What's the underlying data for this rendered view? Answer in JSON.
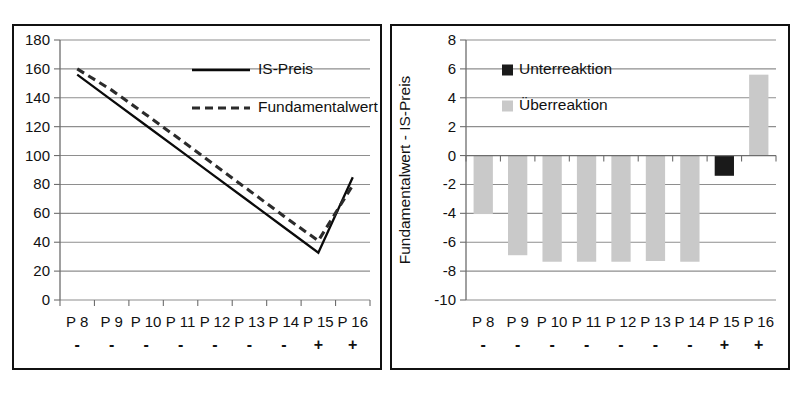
{
  "chart_data": [
    {
      "type": "line",
      "panel": "left",
      "title": "",
      "xlabel": "",
      "ylabel": "",
      "ylim": [
        0,
        180
      ],
      "ytick_labels": [
        "0",
        "20",
        "40",
        "60",
        "80",
        "100",
        "120",
        "140",
        "160",
        "180"
      ],
      "ytick_values": [
        0,
        20,
        40,
        60,
        80,
        100,
        120,
        140,
        160,
        180
      ],
      "grid": true,
      "legend_position": "top-center",
      "categories": [
        "P 8",
        "P 9",
        "P 10",
        "P 11",
        "P 12",
        "P 13",
        "P 14",
        "P 15",
        "P 16"
      ],
      "category_signs": [
        "-",
        "-",
        "-",
        "-",
        "-",
        "-",
        "-",
        "+",
        "+"
      ],
      "series": [
        {
          "name": "IS-Preis",
          "style": "solid",
          "values": [
            156.0,
            138.4,
            120.8,
            103.2,
            85.6,
            68.0,
            50.4,
            32.8,
            85.0
          ]
        },
        {
          "name": "Fundamentalwert",
          "style": "dashed",
          "values": [
            160.0,
            145.3,
            128.3,
            110.9,
            93.3,
            75.7,
            58.0,
            41.0,
            79.5
          ]
        }
      ]
    },
    {
      "type": "bar",
      "panel": "right",
      "title": "",
      "xlabel": "",
      "ylabel": "Fundamentalwert - IS-Preis",
      "ylim": [
        -10,
        8
      ],
      "ytick_labels": [
        "-10",
        "-8",
        "-6",
        "-4",
        "-2",
        "0",
        "2",
        "4",
        "6",
        "8"
      ],
      "ytick_values": [
        -10,
        -8,
        -6,
        -4,
        -2,
        0,
        2,
        4,
        6,
        8
      ],
      "grid": true,
      "legend_position": "top-left",
      "categories": [
        "P 8",
        "P 9",
        "P 10",
        "P 11",
        "P 12",
        "P 13",
        "P 14",
        "P 15",
        "P 16"
      ],
      "category_signs": [
        "-",
        "-",
        "-",
        "-",
        "-",
        "-",
        "-",
        "+",
        "+"
      ],
      "values": [
        -4.05,
        -6.9,
        -7.35,
        -7.35,
        -7.35,
        -7.3,
        -7.35,
        -1.4,
        5.6
      ],
      "bar_kinds": [
        "ueber",
        "ueber",
        "ueber",
        "ueber",
        "ueber",
        "ueber",
        "ueber",
        "unter",
        "ueber"
      ],
      "legend": [
        {
          "name": "Unterreaktion",
          "color": "#1a1a1a"
        },
        {
          "name": "Überreaktion",
          "color": "#c9c9c9"
        }
      ]
    }
  ],
  "left_chart": {
    "legend": {
      "is_preis": "IS-Preis",
      "fundamentalwert": "Fundamentalwert"
    },
    "y_labels": {
      "t0": "0",
      "t1": "20",
      "t2": "40",
      "t3": "60",
      "t4": "80",
      "t5": "100",
      "t6": "120",
      "t7": "140",
      "t8": "160",
      "t9": "180"
    },
    "x_labels": {
      "c0": "P 8",
      "c1": "P 9",
      "c2": "P 10",
      "c3": "P 11",
      "c4": "P 12",
      "c5": "P 13",
      "c6": "P 14",
      "c7": "P 15",
      "c8": "P 16"
    },
    "x_signs": {
      "s0": "-",
      "s1": "-",
      "s2": "-",
      "s3": "-",
      "s4": "-",
      "s5": "-",
      "s6": "-",
      "s7": "+",
      "s8": "+"
    }
  },
  "right_chart": {
    "y_axis_title": "Fundamentalwert - IS-Preis",
    "legend": {
      "unterreaktion": "Unterreaktion",
      "ueberreaktion": "Überreaktion"
    },
    "y_labels": {
      "t0": "-10",
      "t1": "-8",
      "t2": "-6",
      "t3": "-4",
      "t4": "-2",
      "t5": "0",
      "t6": "2",
      "t7": "4",
      "t8": "6",
      "t9": "8"
    },
    "x_labels": {
      "c0": "P 8",
      "c1": "P 9",
      "c2": "P 10",
      "c3": "P 11",
      "c4": "P 12",
      "c5": "P 13",
      "c6": "P 14",
      "c7": "P 15",
      "c8": "P 16"
    },
    "x_signs": {
      "s0": "-",
      "s1": "-",
      "s2": "-",
      "s3": "-",
      "s4": "-",
      "s5": "-",
      "s6": "-",
      "s7": "+",
      "s8": "+"
    }
  },
  "colors": {
    "bar_ueber": "#c9c9c9",
    "bar_unter": "#1a1a1a",
    "grid": "#8e8e8e",
    "line_solid": "#0a0a0a",
    "line_dashed": "#2b2b2b",
    "frame": "#111111"
  }
}
